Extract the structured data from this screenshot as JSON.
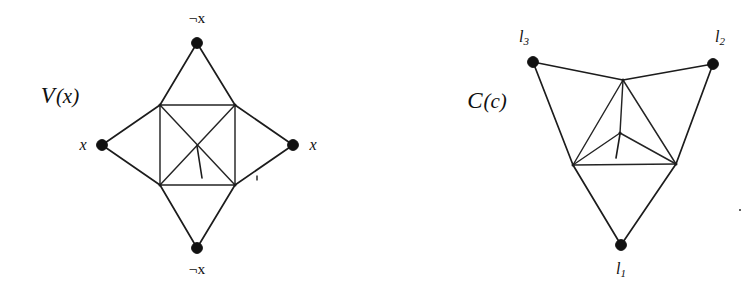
{
  "figure": {
    "background_color": "#ffffff",
    "ink_color": "#111111",
    "panels": [
      {
        "id": "variable-gadget",
        "name_script": "V",
        "name_arg": "(x)",
        "name_full": "V(x)",
        "name_x": 60,
        "name_y": 98,
        "description": "Variable gadget: square with both diagonals, four apex vertices",
        "nodes": [
          {
            "id": "top",
            "cx": 197,
            "cy": 43,
            "r": 5.4,
            "label": "¬x",
            "label_x": 197,
            "label_y": 19,
            "label_anchor": "middle",
            "label_kind": "neg"
          },
          {
            "id": "left",
            "cx": 102,
            "cy": 145,
            "r": 5.4,
            "label": "x",
            "label_x": 83,
            "label_y": 146,
            "label_anchor": "middle",
            "label_kind": "plain"
          },
          {
            "id": "right",
            "cx": 293,
            "cy": 145,
            "r": 5.4,
            "label": "x",
            "label_x": 313,
            "label_y": 146,
            "label_anchor": "middle",
            "label_kind": "plain"
          },
          {
            "id": "bottom",
            "cx": 197,
            "cy": 248,
            "r": 5.4,
            "label": "¬x",
            "label_x": 197,
            "label_y": 270,
            "label_anchor": "middle",
            "label_kind": "neg"
          }
        ],
        "corners": [
          {
            "id": "tl",
            "cx": 160,
            "cy": 105
          },
          {
            "id": "tr",
            "cx": 235,
            "cy": 105
          },
          {
            "id": "bl",
            "cx": 160,
            "cy": 185
          },
          {
            "id": "br",
            "cx": 235,
            "cy": 185
          }
        ],
        "edges": [
          {
            "from": "tl",
            "to": "tr",
            "kind": "square-top"
          },
          {
            "from": "tr",
            "to": "br",
            "kind": "square-right"
          },
          {
            "from": "br",
            "to": "bl",
            "kind": "square-bottom"
          },
          {
            "from": "bl",
            "to": "tl",
            "kind": "square-left"
          },
          {
            "from": "tl",
            "to": "br",
            "kind": "diagonal"
          },
          {
            "from": "tr",
            "to": "bl",
            "kind": "diagonal"
          },
          {
            "from": "top",
            "to": "tl",
            "kind": "apex"
          },
          {
            "from": "top",
            "to": "tr",
            "kind": "apex"
          },
          {
            "from": "left",
            "to": "tl",
            "kind": "apex"
          },
          {
            "from": "left",
            "to": "bl",
            "kind": "apex"
          },
          {
            "from": "right",
            "to": "tr",
            "kind": "apex"
          },
          {
            "from": "right",
            "to": "br",
            "kind": "apex"
          },
          {
            "from": "bottom",
            "to": "bl",
            "kind": "apex"
          },
          {
            "from": "bottom",
            "to": "br",
            "kind": "apex"
          }
        ],
        "stub": {
          "x1": 197,
          "y1": 146,
          "x2": 202,
          "y2": 178
        }
      },
      {
        "id": "clause-gadget",
        "name_script": "C",
        "name_arg": "(c)",
        "name_full": "C(c)",
        "name_x": 487,
        "name_y": 103,
        "description": "Clause gadget: inner triangle with central hub, three outer literal vertices",
        "nodes": [
          {
            "id": "l3",
            "cx": 533,
            "cy": 62,
            "r": 5.4,
            "label": "l",
            "sub": "3",
            "label_x": 524,
            "label_y": 38,
            "label_anchor": "middle",
            "label_kind": "sub"
          },
          {
            "id": "l2",
            "cx": 713,
            "cy": 64,
            "r": 5.4,
            "label": "l",
            "sub": "2",
            "label_x": 720,
            "label_y": 38,
            "label_anchor": "middle",
            "label_kind": "sub"
          },
          {
            "id": "l1",
            "cx": 621,
            "cy": 245,
            "r": 5.4,
            "label": "l",
            "sub": "1",
            "label_x": 621,
            "label_y": 270,
            "label_anchor": "middle",
            "label_kind": "sub"
          }
        ],
        "corners": [
          {
            "id": "it",
            "cx": 623,
            "cy": 80
          },
          {
            "id": "ibl",
            "cx": 573,
            "cy": 165
          },
          {
            "id": "ibr",
            "cx": 676,
            "cy": 164
          },
          {
            "id": "hub",
            "cx": 620,
            "cy": 133
          }
        ],
        "edges": [
          {
            "from": "it",
            "to": "ibl",
            "kind": "triangle"
          },
          {
            "from": "it",
            "to": "ibr",
            "kind": "triangle"
          },
          {
            "from": "ibl",
            "to": "ibr",
            "kind": "triangle"
          },
          {
            "from": "hub",
            "to": "it",
            "kind": "spoke"
          },
          {
            "from": "hub",
            "to": "ibl",
            "kind": "spoke"
          },
          {
            "from": "hub",
            "to": "ibr",
            "kind": "spoke"
          },
          {
            "from": "l3",
            "to": "it",
            "kind": "literal"
          },
          {
            "from": "l3",
            "to": "ibl",
            "kind": "literal"
          },
          {
            "from": "l2",
            "to": "it",
            "kind": "literal"
          },
          {
            "from": "l2",
            "to": "ibr",
            "kind": "literal"
          },
          {
            "from": "l1",
            "to": "ibl",
            "kind": "literal"
          },
          {
            "from": "l1",
            "to": "ibr",
            "kind": "literal"
          }
        ],
        "stub": {
          "x1": 620,
          "y1": 134,
          "x2": 616,
          "y2": 158
        }
      }
    ],
    "specks": [
      {
        "cx": 257,
        "cy": 178,
        "w": 1.6,
        "h": 5
      },
      {
        "cx": 740,
        "cy": 210,
        "w": 1.6,
        "h": 2
      }
    ]
  }
}
